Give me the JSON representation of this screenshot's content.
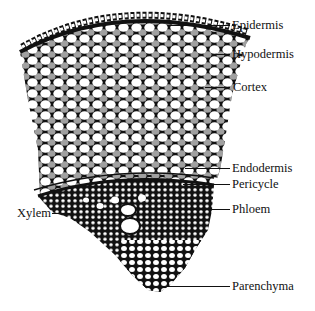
{
  "diagram": {
    "colors": {
      "ink": "#111111",
      "cell_fill": "#ffffff",
      "background": "#ffffff"
    },
    "labels": [
      {
        "id": "epidermis",
        "text": "Epidermis",
        "side": "right"
      },
      {
        "id": "hypodermis",
        "text": "Hypodermis",
        "side": "right"
      },
      {
        "id": "cortex",
        "text": "Cortex",
        "side": "right"
      },
      {
        "id": "endodermis",
        "text": "Endodermis",
        "side": "right"
      },
      {
        "id": "pericycle",
        "text": "Pericycle",
        "side": "right"
      },
      {
        "id": "phloem",
        "text": "Phloem",
        "side": "right"
      },
      {
        "id": "xylem",
        "text": "Xylem",
        "side": "left"
      },
      {
        "id": "parenchyma",
        "text": "Parenchyma",
        "side": "right"
      }
    ]
  }
}
